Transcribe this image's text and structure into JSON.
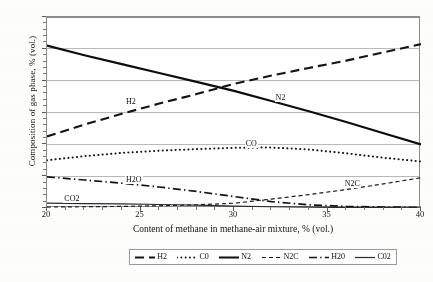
{
  "figure": {
    "background_color": "#fdfdfc",
    "frame_color": "#8c8c8c",
    "grid_color": "#b9b9b9"
  },
  "chart_data": {
    "type": "line",
    "title": "",
    "xlabel": "Content of methane in methane-air mixture, % (vol.)",
    "ylabel": "Composition of gas phase, % (vol.)",
    "xlim": [
      20,
      40
    ],
    "ylim": [
      0,
      60
    ],
    "xticks": [
      20,
      25,
      30,
      35,
      40
    ],
    "yticks": [
      0,
      10,
      20,
      30,
      40,
      50,
      60
    ],
    "xtick_labels": [
      "20",
      "25",
      "30",
      "35",
      "40"
    ],
    "ytick_labels": [
      "0",
      "10",
      "20",
      "30",
      "40",
      "50",
      "60"
    ],
    "grid": "horizontal",
    "legend_position": "below-axis",
    "x": [
      20,
      22,
      24,
      26,
      28,
      30,
      32,
      34,
      36,
      38,
      40
    ],
    "series": [
      {
        "name": "H2",
        "legend_label": "H2",
        "inline_label": "H2",
        "style": "long-dash",
        "color": "#141414",
        "width": 2.1,
        "values": [
          22.5,
          26.2,
          29.6,
          32.8,
          35.8,
          39.0,
          41.6,
          44.0,
          46.3,
          48.9,
          51.5
        ]
      },
      {
        "name": "CO",
        "legend_label": "C0",
        "inline_label": "CO",
        "style": "dotted",
        "color": "#141414",
        "width": 2.0,
        "values": [
          15.0,
          16.3,
          17.3,
          18.0,
          18.5,
          18.9,
          19.0,
          18.4,
          17.2,
          15.8,
          14.6
        ]
      },
      {
        "name": "N2",
        "legend_label": "N2",
        "inline_label": "N2",
        "style": "solid",
        "color": "#0d0d0d",
        "width": 2.2,
        "values": [
          51.0,
          48.0,
          45.2,
          42.4,
          39.6,
          36.8,
          33.6,
          30.4,
          27.0,
          23.5,
          20.0
        ]
      },
      {
        "name": "N2C",
        "legend_label": "N2C",
        "inline_label": "N2C",
        "style": "short-dash",
        "color": "#1a1a1a",
        "width": 1.2,
        "values": [
          0.3,
          0.4,
          0.5,
          0.7,
          1.0,
          1.5,
          2.8,
          4.2,
          5.8,
          7.6,
          9.5
        ]
      },
      {
        "name": "H2O",
        "legend_label": "H20",
        "inline_label": "H2O",
        "style": "dash-dot",
        "color": "#141414",
        "width": 1.7,
        "values": [
          9.8,
          8.8,
          7.8,
          6.6,
          5.2,
          3.6,
          2.0,
          1.0,
          0.5,
          0.3,
          0.2
        ]
      },
      {
        "name": "CO2",
        "legend_label": "C02",
        "inline_label": "CO2",
        "style": "solid",
        "color": "#2a2a2a",
        "width": 1.2,
        "values": [
          1.5,
          1.4,
          1.3,
          1.1,
          0.9,
          0.6,
          0.4,
          0.25,
          0.15,
          0.1,
          0.05
        ]
      }
    ]
  },
  "legend": {
    "items": [
      "H2",
      "C0",
      "N2",
      "N2C",
      "H20",
      "C02"
    ]
  },
  "caption": {
    "stray_text": ""
  }
}
